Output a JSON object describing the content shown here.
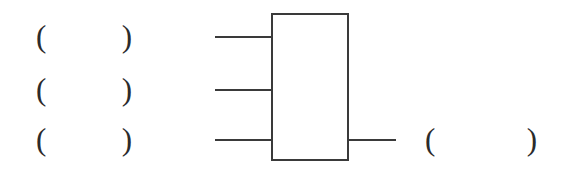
{
  "figure": {
    "type": "block-diagram",
    "background_color": "#ffffff",
    "stroke_color": "#3a3a3a",
    "text_color": "#2b2b2b",
    "width": 577,
    "height": 171
  },
  "input_blanks": [
    {
      "open": "(",
      "value": "",
      "close": ")",
      "placeholder": ""
    },
    {
      "open": "(",
      "value": "",
      "close": ")",
      "placeholder": ""
    },
    {
      "open": "(",
      "value": "",
      "close": ")",
      "placeholder": ""
    }
  ],
  "output_blank": {
    "open": "(",
    "value": "",
    "close": ")",
    "placeholder": ""
  },
  "block": {
    "label": ""
  },
  "wires": {
    "input_count": 3,
    "output_count": 1
  }
}
